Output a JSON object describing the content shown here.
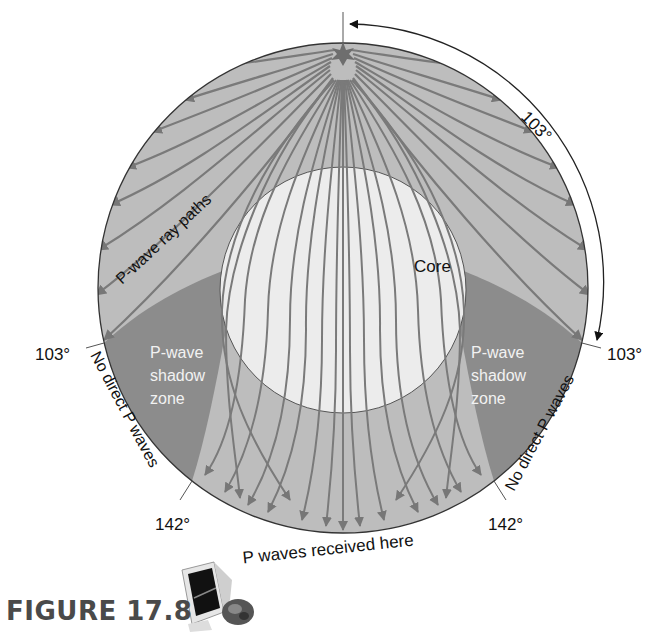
{
  "figure": {
    "caption": "FIGURE 17.8",
    "title": "P-wave shadow zone"
  },
  "labels": {
    "core": "Core",
    "ray_paths": "P-wave ray paths",
    "shadow_left_line1": "P-wave",
    "shadow_left_line2": "shadow",
    "shadow_left_line3": "zone",
    "shadow_right_line1": "P-wave",
    "shadow_right_line2": "shadow",
    "shadow_right_line3": "zone",
    "no_direct_left": "No direct P waves",
    "no_direct_right": "No direct P waves",
    "received_here": "P waves received here",
    "angle_top_arc": "103°",
    "angle_left_103": "103°",
    "angle_right_103": "103°",
    "angle_left_142": "142°",
    "angle_right_142": "142°"
  },
  "icons": {
    "epicenter": "star-burst-icon",
    "multimedia": "computer-monitor-cd-icon"
  },
  "colors": {
    "mantle": "#bcbcbc",
    "shadow_zone": "#8a8a8a",
    "core": "#ececec",
    "ray": "#7a7a7a",
    "outline": "#333333",
    "caption": "#4a4a4a"
  }
}
